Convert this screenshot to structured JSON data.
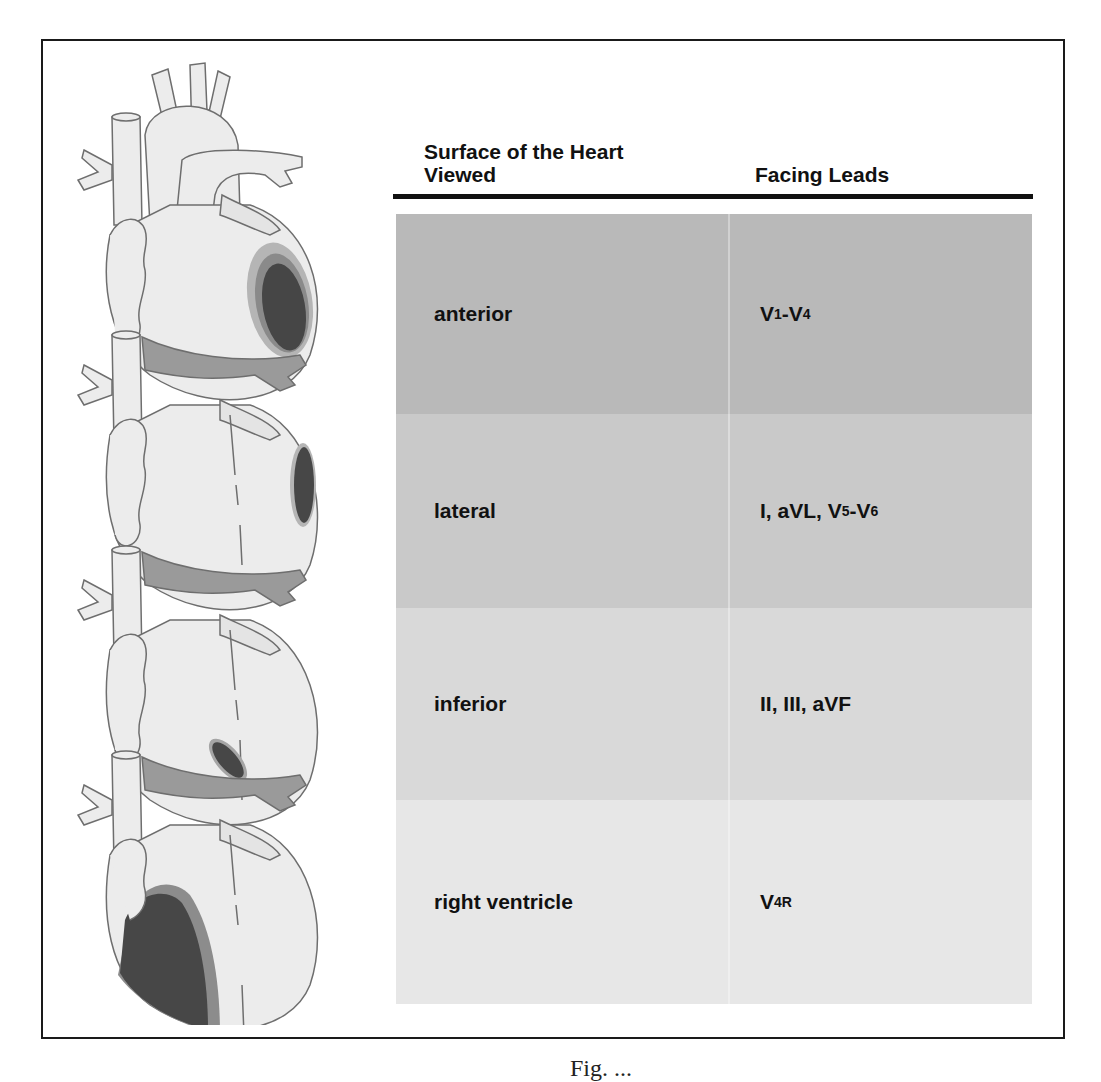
{
  "figure": {
    "table": {
      "headers": {
        "surface": "Surface of the Heart Viewed",
        "leads": "Facing Leads"
      },
      "rows": [
        {
          "surface": "anterior",
          "leads_parts": [
            [
              "V",
              "1"
            ],
            [
              "-V",
              "4"
            ]
          ],
          "leads_text": "V1-V4",
          "shade": "#b9b9b9"
        },
        {
          "surface": "lateral",
          "leads_parts": [
            [
              "I, aVL, V",
              "5"
            ],
            [
              "-V",
              "6"
            ]
          ],
          "leads_text": "I, aVL, V5-V6",
          "shade": "#c9c9c9"
        },
        {
          "surface": "inferior",
          "leads_parts": [
            [
              "II, III, aVF",
              ""
            ]
          ],
          "leads_text": "II, III, aVF",
          "shade": "#d9d9d9"
        },
        {
          "surface": "right ventricle",
          "leads_parts": [
            [
              "V",
              "4R"
            ]
          ],
          "leads_text": "V4R",
          "shade": "#e7e7e7"
        }
      ]
    },
    "illustration": {
      "description": "Four stacked heart drawings, each with a shaded infarct region",
      "regions": [
        "anterior",
        "lateral",
        "inferior",
        "right ventricle"
      ],
      "colors": {
        "outline": "#6e6e6e",
        "heart_fill": "#ececec",
        "vessel_shadow": "#9a9a9a",
        "infarct_core": "#4a4a4a",
        "infarct_halo": "#a8a8a8"
      }
    },
    "caption_clipped": "Fig. ..."
  }
}
